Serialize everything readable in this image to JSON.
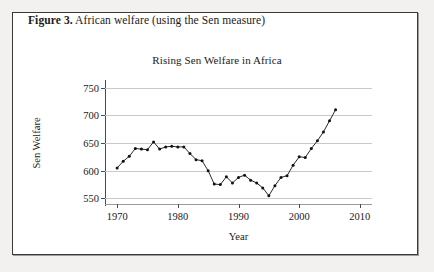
{
  "caption": {
    "label": "Figure 3.",
    "text": " African welfare (using the Sen measure)"
  },
  "chart_data": {
    "type": "line",
    "title": "Rising Sen Welfare in Africa",
    "xlabel": "Year",
    "ylabel": "Sen Welfare",
    "xlim": [
      1968,
      2012
    ],
    "ylim": [
      540,
      760
    ],
    "xticks": [
      1970,
      1980,
      1990,
      2000,
      2010
    ],
    "yticks": [
      550,
      600,
      650,
      700,
      750
    ],
    "grid": true,
    "legend": "none",
    "marker": "filled-circle",
    "line_color": "#111111",
    "grid_color": "#c9c9c9",
    "x": [
      1970,
      1971,
      1972,
      1973,
      1974,
      1975,
      1976,
      1977,
      1978,
      1979,
      1980,
      1981,
      1982,
      1983,
      1984,
      1985,
      1986,
      1987,
      1988,
      1989,
      1990,
      1991,
      1992,
      1993,
      1994,
      1995,
      1996,
      1997,
      1998,
      1999,
      2000,
      2001,
      2002,
      2003,
      2004,
      2005,
      2006
    ],
    "values": [
      605,
      617,
      626,
      640,
      639,
      638,
      652,
      639,
      643,
      644,
      643,
      643,
      631,
      620,
      618,
      600,
      576,
      575,
      589,
      578,
      588,
      592,
      583,
      578,
      569,
      555,
      573,
      588,
      591,
      610,
      625,
      624,
      640,
      654,
      670,
      690,
      710
    ]
  }
}
